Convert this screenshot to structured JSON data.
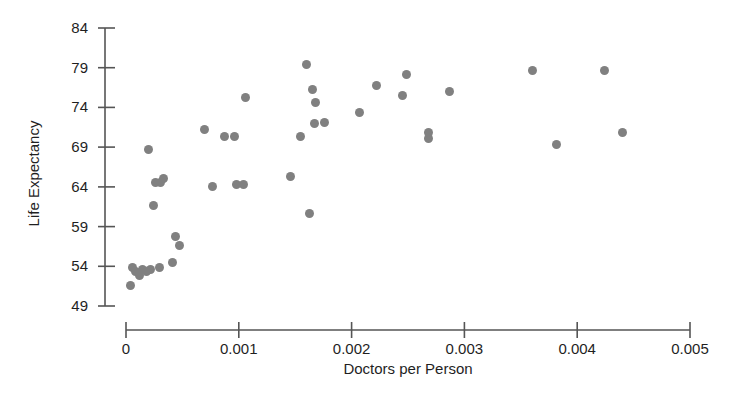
{
  "chart_data": {
    "type": "scatter",
    "title": "",
    "xlabel": "Doctors per Person",
    "ylabel": "Life Expectancy",
    "xlim": [
      0,
      0.005
    ],
    "ylim": [
      49,
      84
    ],
    "xticks": [
      0,
      0.001,
      0.002,
      0.003,
      0.004,
      0.005
    ],
    "xtick_labels": [
      "0",
      "0.001",
      "0.002",
      "0.003",
      "0.004",
      "0.005"
    ],
    "yticks": [
      49,
      54,
      59,
      64,
      69,
      74,
      79,
      84
    ],
    "ytick_labels": [
      "49",
      "54",
      "59",
      "64",
      "69",
      "74",
      "79",
      "84"
    ],
    "grid": false,
    "legend": null,
    "marker_color": "#808080",
    "marker_shape": "circle",
    "axis_color": "#555555",
    "background": "#ffffff",
    "points": [
      {
        "x": 4e-05,
        "y": 51.6
      },
      {
        "x": 6e-05,
        "y": 53.9
      },
      {
        "x": 8e-05,
        "y": 53.4
      },
      {
        "x": 0.00012,
        "y": 52.9
      },
      {
        "x": 0.00015,
        "y": 53.6
      },
      {
        "x": 0.00018,
        "y": 53.3
      },
      {
        "x": 0.00022,
        "y": 53.6
      },
      {
        "x": 0.0003,
        "y": 53.8
      },
      {
        "x": 0.0002,
        "y": 68.7
      },
      {
        "x": 0.00024,
        "y": 61.6
      },
      {
        "x": 0.00026,
        "y": 64.5
      },
      {
        "x": 0.00031,
        "y": 64.6
      },
      {
        "x": 0.00033,
        "y": 65.1
      },
      {
        "x": 0.00041,
        "y": 54.5
      },
      {
        "x": 0.00044,
        "y": 57.8
      },
      {
        "x": 0.00047,
        "y": 56.6
      },
      {
        "x": 0.0007,
        "y": 71.2
      },
      {
        "x": 0.00077,
        "y": 64.1
      },
      {
        "x": 0.00087,
        "y": 70.3
      },
      {
        "x": 0.00096,
        "y": 70.3
      },
      {
        "x": 0.00098,
        "y": 64.3
      },
      {
        "x": 0.00104,
        "y": 64.3
      },
      {
        "x": 0.00106,
        "y": 75.2
      },
      {
        "x": 0.00146,
        "y": 65.3
      },
      {
        "x": 0.00155,
        "y": 70.3
      },
      {
        "x": 0.0016,
        "y": 79.4
      },
      {
        "x": 0.00163,
        "y": 60.6
      },
      {
        "x": 0.00165,
        "y": 76.3
      },
      {
        "x": 0.00168,
        "y": 74.6
      },
      {
        "x": 0.00167,
        "y": 72.0
      },
      {
        "x": 0.00176,
        "y": 72.1
      },
      {
        "x": 0.00207,
        "y": 73.3
      },
      {
        "x": 0.00222,
        "y": 76.7
      },
      {
        "x": 0.00245,
        "y": 75.5
      },
      {
        "x": 0.00249,
        "y": 78.2
      },
      {
        "x": 0.00268,
        "y": 70.1
      },
      {
        "x": 0.00268,
        "y": 70.8
      },
      {
        "x": 0.00287,
        "y": 76.0
      },
      {
        "x": 0.0036,
        "y": 78.6
      },
      {
        "x": 0.00382,
        "y": 69.3
      },
      {
        "x": 0.00424,
        "y": 78.6
      },
      {
        "x": 0.0044,
        "y": 70.8
      }
    ]
  }
}
